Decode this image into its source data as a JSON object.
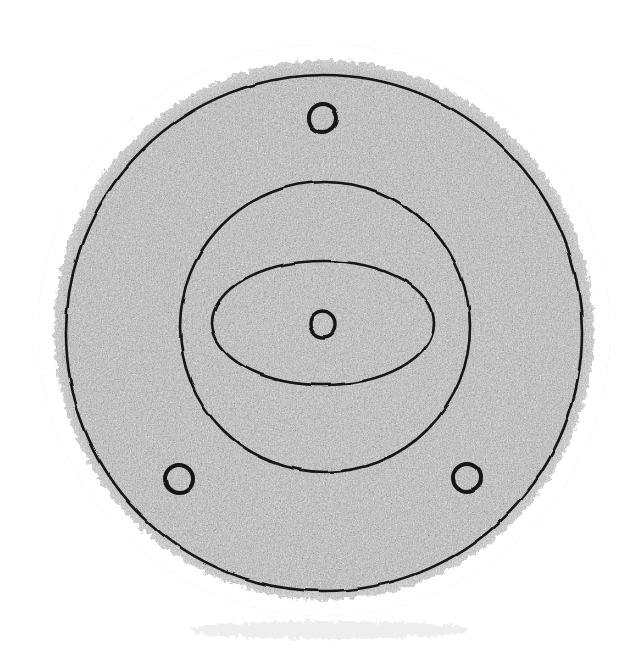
{
  "figure": {
    "title": "Circular flange plate — plan view",
    "domain_kind": "technical-line-drawing",
    "canvas": {
      "width": 643,
      "height": 660
    },
    "background_color": "#ffffff",
    "line_color": "#141414",
    "fill_texture_color": "#a9a9a9",
    "texture_style": "stippled-halftone-grain",
    "shapes": [
      {
        "id": "outer-disc-body",
        "name": "outer-disc-body",
        "kind": "circle",
        "cx": 324,
        "cy": 330,
        "r": 285,
        "stroke": "none",
        "fill": "texture",
        "label": "Textured outer disc body"
      },
      {
        "id": "outer-ring-line",
        "name": "outer-ring-line",
        "kind": "circle",
        "cx": 324,
        "cy": 333,
        "r": 258,
        "stroke": "#141414",
        "stroke_width": 2.6,
        "fill": "none",
        "label": "Outer rim circle"
      },
      {
        "id": "middle-ring-line",
        "name": "middle-ring-line",
        "kind": "circle",
        "cx": 325,
        "cy": 327,
        "r": 145,
        "stroke": "#141414",
        "stroke_width": 2.6,
        "fill": "none",
        "label": "Middle boss circle"
      },
      {
        "id": "center-ellipse",
        "name": "center-ellipse",
        "kind": "ellipse",
        "cx": 323,
        "cy": 323,
        "rx": 111,
        "ry": 62,
        "stroke": "#141414",
        "stroke_width": 2.6,
        "fill": "none",
        "label": "Central elliptical recess"
      },
      {
        "id": "center-hole",
        "name": "center-hole",
        "kind": "circle",
        "cx": 323,
        "cy": 324,
        "r": 13,
        "stroke": "#141414",
        "stroke_width": 3.4,
        "fill": "none",
        "label": "Central bore hole"
      }
    ],
    "bolt_holes": [
      {
        "id": "bolt-hole-top",
        "name": "bolt-hole-top",
        "position": "top",
        "cx": 323,
        "cy": 118,
        "r": 14,
        "stroke": "#141414",
        "stroke_width": 4,
        "label": "Top bolt hole"
      },
      {
        "id": "bolt-hole-bottom-left",
        "name": "bolt-hole-bottom-left",
        "position": "bottom-left",
        "cx": 179,
        "cy": 479,
        "r": 14,
        "stroke": "#141414",
        "stroke_width": 4,
        "label": "Bottom-left bolt hole"
      },
      {
        "id": "bolt-hole-bottom-right",
        "name": "bolt-hole-bottom-right",
        "position": "bottom-right",
        "cx": 467,
        "cy": 478,
        "r": 14,
        "stroke": "#141414",
        "stroke_width": 4,
        "label": "Bottom-right bolt hole"
      }
    ],
    "captions": []
  }
}
